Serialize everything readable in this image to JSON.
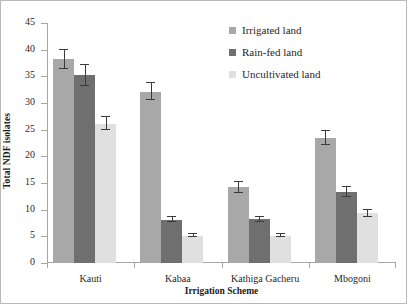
{
  "chart_data": {
    "type": "bar",
    "title": "",
    "xlabel": "Irrigation Scheme",
    "ylabel": "Total NDF isolates",
    "categories": [
      "Kauti",
      "Kabaa",
      "Kathiga Gacheru",
      "Mbogoni"
    ],
    "series": [
      {
        "name": "Irrigated land",
        "color": "#a8a8a8",
        "values": [
          38.2,
          32.1,
          14.2,
          23.4
        ],
        "errors": [
          1.8,
          1.6,
          1.0,
          1.3
        ]
      },
      {
        "name": "Rain-fed land",
        "color": "#6f6f6f",
        "values": [
          35.2,
          8.1,
          8.2,
          13.3
        ],
        "errors": [
          2.0,
          0.5,
          0.5,
          0.9
        ]
      },
      {
        "name": "Uncultivated land",
        "color": "#e0e0e0",
        "values": [
          26.1,
          5.1,
          5.1,
          9.3
        ],
        "errors": [
          1.2,
          0.3,
          0.3,
          0.6
        ]
      }
    ],
    "ylim": [
      0,
      45
    ],
    "yticks": [
      0,
      5,
      10,
      15,
      20,
      25,
      30,
      35,
      40,
      45
    ],
    "ytick_labels": [
      "0",
      "5",
      "10",
      "15",
      "20",
      "25",
      "30",
      "35",
      "40",
      "45"
    ],
    "grid": false,
    "legend_position": "top-right",
    "error_bar_type": "standard-error"
  },
  "legend": {
    "items": [
      {
        "label": "Irrigated land"
      },
      {
        "label": "Rain-fed land"
      },
      {
        "label": "Uncultivated land"
      }
    ]
  }
}
